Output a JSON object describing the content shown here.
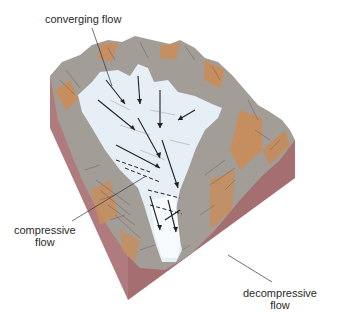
{
  "diagram": {
    "type": "block diagram of glacier flow in a mountain valley",
    "labels": {
      "converging": "converging flow",
      "compressive_1": "compressive",
      "compressive_2": "flow",
      "decompressive_1": "decompressive",
      "decompressive_2": "flow"
    },
    "colors": {
      "block_side": "#b07b7e",
      "block_side_dark": "#9a6669",
      "rock_gray": "#a39d97",
      "rock_orange": "#cc8c55",
      "ice": "#e6eef6",
      "ice_white": "#f7fafd",
      "arrow": "#222222",
      "leader": "#333333"
    }
  }
}
